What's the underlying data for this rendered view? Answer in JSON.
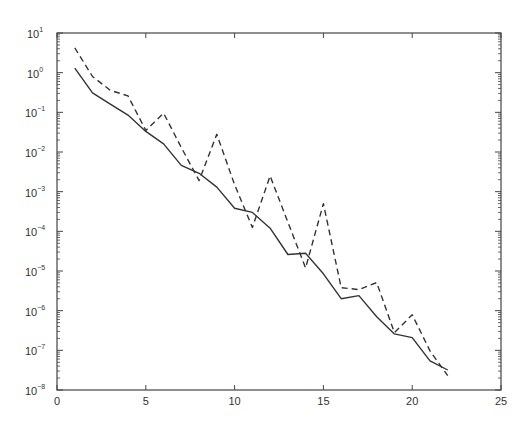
{
  "chart_data": {
    "type": "line",
    "title": "",
    "xlabel": "",
    "ylabel": "",
    "xscale": "linear",
    "yscale": "log",
    "xlim": [
      0,
      25
    ],
    "ylim": [
      1e-08,
      10
    ],
    "xticks": [
      0,
      5,
      10,
      15,
      20,
      25
    ],
    "yticks_exponents": [
      1,
      0,
      -1,
      -2,
      -3,
      -4,
      -5,
      -6,
      -7,
      -8
    ],
    "grid": false,
    "legend": null,
    "x": [
      1,
      2,
      3,
      4,
      5,
      6,
      7,
      8,
      9,
      10,
      11,
      12,
      13,
      14,
      15,
      16,
      17,
      18,
      19,
      20,
      21,
      22
    ],
    "series": [
      {
        "name": "solid",
        "style": "solid",
        "values": [
          1.3,
          0.31,
          0.16,
          0.085,
          0.033,
          0.016,
          0.0046,
          0.0029,
          0.0013,
          0.00038,
          0.0003,
          0.00012,
          2.6e-05,
          2.8e-05,
          8.5e-06,
          2e-06,
          2.4e-06,
          7e-07,
          2.6e-07,
          2.1e-07,
          5.4e-08,
          3.2e-08
        ]
      },
      {
        "name": "dashed",
        "style": "dashed",
        "values": [
          4.2,
          0.8,
          0.36,
          0.26,
          0.035,
          0.095,
          0.013,
          0.0019,
          0.028,
          0.0015,
          0.000126,
          0.0025,
          0.00017,
          1.2e-05,
          0.0005,
          3.8e-06,
          3.4e-06,
          5.1e-06,
          2.8e-07,
          7.9e-07,
          9.7e-08,
          2.3e-08
        ]
      }
    ]
  },
  "colors": {
    "line": "#333333",
    "axis": "#444444"
  }
}
